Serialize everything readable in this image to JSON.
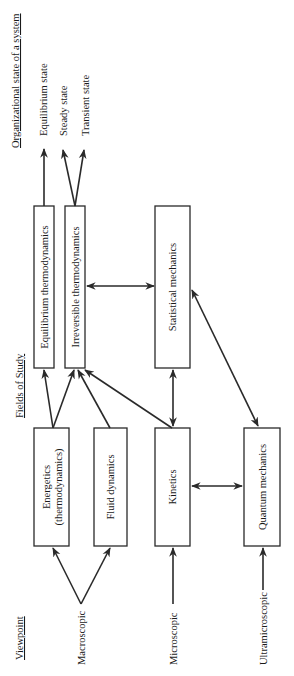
{
  "diagram": {
    "orientation": "rotated-90-ccw",
    "headers": {
      "viewpoint": "Viewpoint",
      "fields": "Fields of Study",
      "states": "Organizational state of a system"
    },
    "viewpoints": [
      {
        "id": "macroscopic",
        "label": "Macroscopic"
      },
      {
        "id": "microscopic",
        "label": "Microscopic"
      },
      {
        "id": "ultramicroscopic",
        "label": "Ultramicroscopic"
      }
    ],
    "fields": [
      {
        "id": "energetics",
        "label_line1": "Energetics",
        "label_line2": "(thermodynamics)"
      },
      {
        "id": "fluid",
        "label": "Fluid dynamics"
      },
      {
        "id": "kinetics",
        "label": "Kinetics"
      },
      {
        "id": "quantum",
        "label": "Quantum mechanics"
      },
      {
        "id": "equilibrium_thermo",
        "label": "Equilibrium thermodynamics"
      },
      {
        "id": "irreversible_thermo",
        "label": "Irreversible thermodynamics"
      },
      {
        "id": "statistical",
        "label": "Statistical mechanics"
      }
    ],
    "states": [
      {
        "id": "equilibrium",
        "label": "Equilibrium state"
      },
      {
        "id": "steady",
        "label": "Steady state"
      },
      {
        "id": "transient",
        "label": "Transient state"
      }
    ],
    "edges": [
      {
        "from": "macroscopic",
        "to": "energetics",
        "type": "directed"
      },
      {
        "from": "macroscopic",
        "to": "fluid",
        "type": "directed"
      },
      {
        "from": "microscopic",
        "to": "kinetics",
        "type": "directed"
      },
      {
        "from": "ultramicroscopic",
        "to": "quantum",
        "type": "directed"
      },
      {
        "from": "kinetics",
        "to": "quantum",
        "type": "bidirectional"
      },
      {
        "from": "kinetics",
        "to": "statistical",
        "type": "bidirectional"
      },
      {
        "from": "irreversible_thermo",
        "to": "statistical",
        "type": "bidirectional"
      },
      {
        "from": "statistical",
        "to": "quantum",
        "type": "bidirectional"
      },
      {
        "from": "energetics",
        "to": "equilibrium_thermo",
        "type": "directed"
      },
      {
        "from": "energetics",
        "to": "irreversible_thermo",
        "type": "directed"
      },
      {
        "from": "fluid",
        "to": "irreversible_thermo",
        "type": "directed"
      },
      {
        "from": "kinetics",
        "to": "irreversible_thermo",
        "type": "directed"
      },
      {
        "from": "equilibrium_thermo",
        "to": "equilibrium",
        "type": "directed"
      },
      {
        "from": "irreversible_thermo",
        "to": "steady",
        "type": "directed"
      },
      {
        "from": "irreversible_thermo",
        "to": "transient",
        "type": "directed"
      }
    ]
  }
}
